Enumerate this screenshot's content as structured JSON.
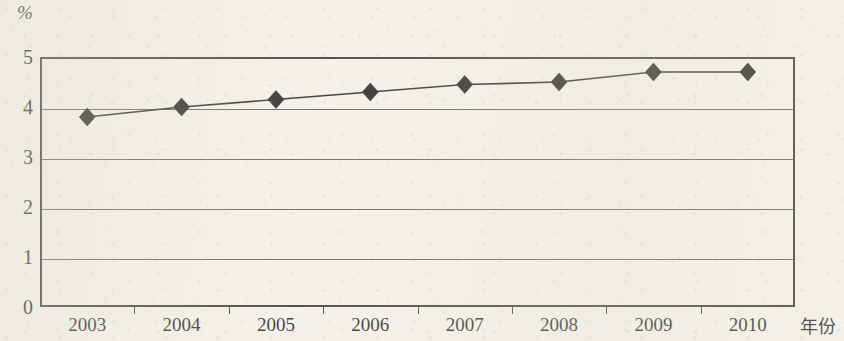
{
  "chart_data": {
    "type": "line",
    "title": "",
    "subtitle": "",
    "xlabel": "年份",
    "ylabel": "%",
    "categories": [
      "2003",
      "2004",
      "2005",
      "2006",
      "2007",
      "2008",
      "2009",
      "2010"
    ],
    "values": [
      3.8,
      4.0,
      4.15,
      4.3,
      4.45,
      4.5,
      4.7,
      4.7
    ],
    "series": [
      {
        "name": "",
        "values": [
          3.8,
          4.0,
          4.15,
          4.3,
          4.45,
          4.5,
          4.7,
          4.7
        ]
      }
    ],
    "ylim": [
      0,
      5
    ],
    "y_ticks": [
      "0",
      "1",
      "2",
      "3",
      "4",
      "5"
    ],
    "y_tick_values": [
      0,
      1,
      2,
      3,
      4,
      5
    ],
    "grid": true,
    "grid_axis": "y",
    "legend": false,
    "legend_position": "none",
    "marker": "diamond",
    "line_color": "#17150f",
    "marker_color": "#100e0a",
    "grid_color": "#55514a",
    "frame_color": "#2b2823",
    "background_color": "#f4f1ea"
  },
  "axes": {
    "y_unit_label": "%",
    "x_axis_title": "年份"
  }
}
